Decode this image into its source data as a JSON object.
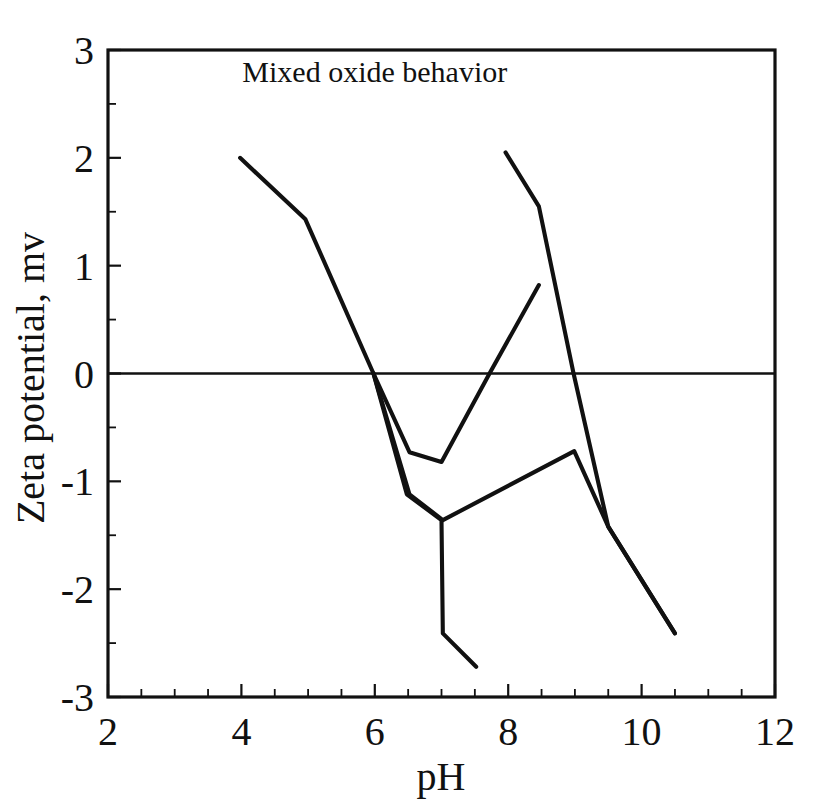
{
  "chart_data": {
    "type": "line",
    "title": "Mixed oxide behavior",
    "xlabel": "pH",
    "ylabel": "Zeta potential, mv",
    "xlim": [
      2,
      12
    ],
    "ylim": [
      -3,
      3
    ],
    "x_ticks": [
      2,
      4,
      6,
      8,
      10,
      12
    ],
    "x_tick_labels": [
      "2",
      "4",
      "6",
      "8",
      "10",
      "12"
    ],
    "x_minor_step": 0.5,
    "y_ticks": [
      -3,
      -2,
      -1,
      0,
      1,
      2,
      3
    ],
    "y_tick_labels": [
      "-3",
      "-2",
      "-1",
      "0",
      "1",
      "2",
      "3"
    ],
    "y_minor_step": 0.5,
    "grid": false,
    "legend": "none",
    "zero_reference_line": 0,
    "line_color": "#111111",
    "background_color": "#ffffff",
    "series": [
      {
        "name": "acid-branch-descending",
        "points": [
          [
            3.98,
            2.0
          ],
          [
            4.96,
            1.43
          ],
          [
            5.98,
            0.0
          ],
          [
            6.48,
            -1.12
          ],
          [
            7.0,
            -1.36
          ],
          [
            7.02,
            -2.41
          ],
          [
            7.52,
            -2.72
          ]
        ]
      },
      {
        "name": "upper-valley-branch",
        "points": [
          [
            5.98,
            0.0
          ],
          [
            6.52,
            -0.73
          ],
          [
            7.0,
            -0.82
          ],
          [
            7.72,
            0.0
          ],
          [
            8.46,
            0.82
          ]
        ]
      },
      {
        "name": "lower-valley-branch",
        "points": [
          [
            5.98,
            0.0
          ],
          [
            6.52,
            -1.12
          ],
          [
            7.02,
            -1.36
          ],
          [
            8.99,
            -0.72
          ],
          [
            9.5,
            -1.42
          ],
          [
            10.5,
            -2.41
          ]
        ]
      },
      {
        "name": "base-branch-descending",
        "points": [
          [
            7.96,
            2.05
          ],
          [
            8.46,
            1.55
          ],
          [
            8.98,
            0.0
          ],
          [
            9.5,
            -1.42
          ],
          [
            10.5,
            -2.41
          ]
        ]
      }
    ]
  },
  "figure": {
    "title_text": "Mixed oxide behavior",
    "x_axis_label": "pH",
    "y_axis_label": "Zeta potential, mv"
  }
}
